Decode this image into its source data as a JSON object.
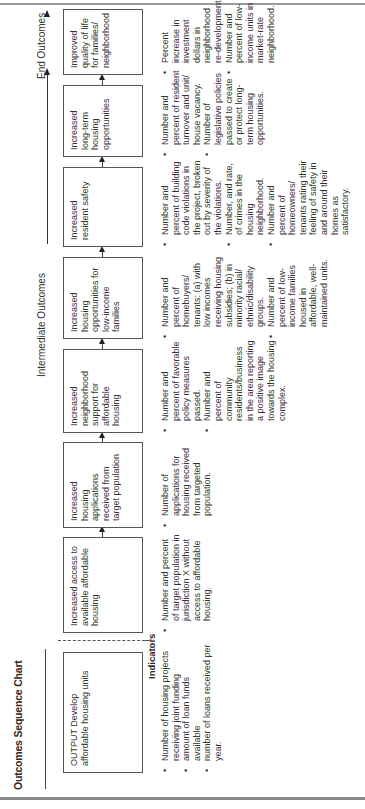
{
  "title": "Outcomes Sequence Chart",
  "stages": {
    "intermediate": "Intermediate Outcomes",
    "end": "End Outcomes"
  },
  "indicators_heading": "Indicators",
  "boxes": [
    {
      "text": "OUTPUT Develop affordable housing units"
    },
    {
      "text": "Increased access to available affordable housing"
    },
    {
      "text": "Increased housing applications received from target population"
    },
    {
      "text": "Increased neighborhood support for affordable housing"
    },
    {
      "text": "Increased housing opportunities for low-income families"
    },
    {
      "text": "Increased resident safety"
    },
    {
      "text": "Increased long-term housing opportunities"
    },
    {
      "text": "Improved quality of life for families/ neighborhood"
    }
  ],
  "indicators": [
    [
      "Number of housing projects receiving joint funding",
      "amount of loan funds available",
      "number of loans received per year."
    ],
    [
      "Number and percent of target population in jurisdiction X without access to affordable housing."
    ],
    [
      "Number of applications for housing received from targeted population."
    ],
    [
      "Number and percent of favorable policy measures passed.",
      "Number and percent of community residents/business in the area reporting a positive image towards the housing complex."
    ],
    [
      "Number and percent of homebuyers/ tenants: (a) with low incomes receiving housing subsidies; (b) in minority racial/ ethnic/disability groups.",
      "Number and percent of low-income families housed in affordable, well-maintained units."
    ],
    [
      "Number and percent of building code violations in the project, broken out by severity of the violations.",
      "Number, and rate, of crimes in the housing neighborhood.",
      "Number and percent of homeowners/ tenants rating their feeling of safety in and around their homes as satisfactory."
    ],
    [
      "Number and percent of resident turnover and unit/ house vacancy.",
      "Number of legislative policies passed to create or protect long-term housing opportunities."
    ],
    [
      "Percent increase in investment dollars in neighborhood re-development.",
      "Number and percent of low-income units in market-rate neighborhood."
    ]
  ]
}
